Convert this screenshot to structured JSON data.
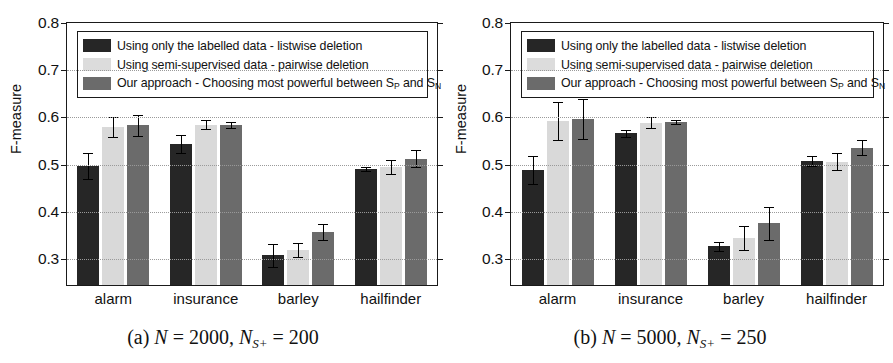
{
  "figure": {
    "panels": [
      {
        "id": "panel-a",
        "caption_prefix": "(a)",
        "caption_n_sym": "N",
        "caption_n_val": "= 2000,",
        "caption_ns_sym": "N",
        "caption_ns_sub": "S+",
        "caption_ns_val": "= 200",
        "caption_plain": "(a) N = 2000, N_S+ = 200"
      },
      {
        "id": "panel-b",
        "caption_prefix": "(b)",
        "caption_n_sym": "N",
        "caption_n_val": "= 5000,",
        "caption_ns_sym": "N",
        "caption_ns_sub": "S+",
        "caption_ns_val": "= 250",
        "caption_plain": "(b) N = 5000, N_S+ = 250"
      }
    ],
    "legend": {
      "items": [
        {
          "swatch": "s0",
          "text_main": "Using only the labelled data  - listwise deletion",
          "sub_p": "",
          "sub_n": "",
          "tail": ""
        },
        {
          "swatch": "s1",
          "text_main": "Using semi-supervised data - pairwise deletion",
          "sub_p": "",
          "sub_n": "",
          "tail": ""
        },
        {
          "swatch": "s2",
          "text_main": "Our approach - Choosing most powerful between S",
          "sub_p": "P",
          "tail": " and S",
          "sub_n": "N"
        }
      ]
    },
    "colors": {
      "series_labelled": "#262626",
      "series_semisupervised": "#d9d9d9",
      "series_our_approach": "#6b6b6b",
      "axis": "#1a1a1a",
      "grid": "#9a9a9a",
      "background": "#ffffff"
    }
  },
  "chart_data": [
    {
      "type": "bar",
      "title": "(a) N = 2000, N_S+ = 200",
      "xlabel": "",
      "ylabel": "F-measure",
      "ylim": [
        0.245,
        0.8
      ],
      "yticks": [
        0.3,
        0.4,
        0.5,
        0.6,
        0.7,
        0.8
      ],
      "ytick_labels": [
        "0.3",
        "0.4",
        "0.5",
        "0.6",
        "0.7",
        "0.8"
      ],
      "grid": true,
      "legend_position": "upper-left-inside",
      "categories": [
        "alarm",
        "insurance",
        "barley",
        "hailfinder"
      ],
      "series": [
        {
          "name": "Using only the labelled data  - listwise deletion",
          "color": "#262626",
          "values": [
            0.497,
            0.543,
            0.308,
            0.491
          ],
          "errors": [
            0.028,
            0.019,
            0.024,
            0.005
          ]
        },
        {
          "name": "Using semi-supervised data - pairwise deletion",
          "color": "#d9d9d9",
          "values": [
            0.58,
            0.585,
            0.319,
            0.495
          ],
          "errors": [
            0.021,
            0.01,
            0.015,
            0.014
          ]
        },
        {
          "name": "Our approach - Choosing most powerful between S_P and S_N",
          "color": "#6b6b6b",
          "values": [
            0.583,
            0.584,
            0.357,
            0.512
          ],
          "errors": [
            0.023,
            0.006,
            0.017,
            0.018
          ]
        }
      ]
    },
    {
      "type": "bar",
      "title": "(b) N = 5000, N_S+ = 250",
      "xlabel": "",
      "ylabel": "F-measure",
      "ylim": [
        0.245,
        0.8
      ],
      "yticks": [
        0.3,
        0.4,
        0.5,
        0.6,
        0.7,
        0.8
      ],
      "ytick_labels": [
        "0.3",
        "0.4",
        "0.5",
        "0.6",
        "0.7",
        "0.8"
      ],
      "grid": true,
      "legend_position": "upper-left-inside",
      "categories": [
        "alarm",
        "insurance",
        "barley",
        "hailfinder"
      ],
      "series": [
        {
          "name": "Using only the labelled data  - listwise deletion",
          "color": "#262626",
          "values": [
            0.488,
            0.566,
            0.327,
            0.508
          ],
          "errors": [
            0.03,
            0.008,
            0.009,
            0.011
          ]
        },
        {
          "name": "Using semi-supervised data - pairwise deletion",
          "color": "#d9d9d9",
          "values": [
            0.592,
            0.589,
            0.345,
            0.506
          ],
          "errors": [
            0.04,
            0.012,
            0.026,
            0.018
          ]
        },
        {
          "name": "Our approach - Choosing most powerful between S_P and S_N",
          "color": "#6b6b6b",
          "values": [
            0.597,
            0.591,
            0.376,
            0.536
          ],
          "errors": [
            0.043,
            0.004,
            0.035,
            0.016
          ]
        }
      ]
    }
  ]
}
